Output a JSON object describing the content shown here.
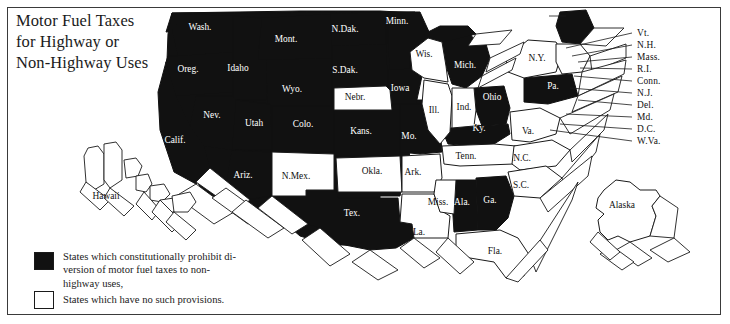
{
  "title": {
    "line1": "Motor Fuel Taxes",
    "line2": "for Highway or",
    "line3": "Non-Highway Uses"
  },
  "legend": {
    "items": [
      {
        "swatch": "black",
        "line1": "States which constitutionally prohibit di-",
        "line2": "version of motor fuel taxes to non-",
        "line3": "highway uses,"
      },
      {
        "swatch": "white",
        "line1": "States which have no such provisions."
      }
    ]
  },
  "colors": {
    "prohibit_fill": "#111111",
    "no_provision_fill": "#ffffff",
    "stroke": "#1a1a1a",
    "label_on_black": "#ffffff",
    "label_on_white": "#111111",
    "frame": "#3a3a3a",
    "page_background": "#ffffff"
  },
  "map": {
    "title": "Motor Fuel Taxes for Highway or Non-Highway Uses",
    "projection_note": "stylized 3D extruded block map of the United States",
    "states": [
      {
        "abbr": "Wash.",
        "name": "Washington",
        "status": "prohibit",
        "label_x": 200,
        "label_y": 30
      },
      {
        "abbr": "Oreg.",
        "name": "Oregon",
        "status": "prohibit",
        "label_x": 188,
        "label_y": 72
      },
      {
        "abbr": "Idaho",
        "name": "Idaho",
        "status": "prohibit",
        "label_x": 238,
        "label_y": 71
      },
      {
        "abbr": "Mont.",
        "name": "Montana",
        "status": "prohibit",
        "label_x": 286,
        "label_y": 42
      },
      {
        "abbr": "N.Dak.",
        "name": "North Dakota",
        "status": "prohibit",
        "label_x": 345,
        "label_y": 32
      },
      {
        "abbr": "S.Dak.",
        "name": "South Dakota",
        "status": "prohibit",
        "label_x": 345,
        "label_y": 73
      },
      {
        "abbr": "Wyo.",
        "name": "Wyoming",
        "status": "prohibit",
        "label_x": 292,
        "label_y": 92
      },
      {
        "abbr": "Nev.",
        "name": "Nevada",
        "status": "prohibit",
        "label_x": 212,
        "label_y": 118
      },
      {
        "abbr": "Utah",
        "name": "Utah",
        "status": "prohibit",
        "label_x": 254,
        "label_y": 126
      },
      {
        "abbr": "Colo.",
        "name": "Colorado",
        "status": "prohibit",
        "label_x": 303,
        "label_y": 127
      },
      {
        "abbr": "Calif.",
        "name": "California",
        "status": "prohibit",
        "label_x": 175,
        "label_y": 143
      },
      {
        "abbr": "Ariz.",
        "name": "Arizona",
        "status": "prohibit",
        "label_x": 243,
        "label_y": 178
      },
      {
        "abbr": "N.Mex.",
        "name": "New Mexico",
        "status": "no-provision",
        "label_x": 296,
        "label_y": 179
      },
      {
        "abbr": "Nebr.",
        "name": "Nebraska",
        "status": "no-provision",
        "label_x": 355,
        "label_y": 100
      },
      {
        "abbr": "Kans.",
        "name": "Kansas",
        "status": "prohibit",
        "label_x": 361,
        "label_y": 134
      },
      {
        "abbr": "Okla.",
        "name": "Oklahoma",
        "status": "no-provision",
        "label_x": 372,
        "label_y": 174
      },
      {
        "abbr": "Tex.",
        "name": "Texas",
        "status": "prohibit",
        "label_x": 352,
        "label_y": 216
      },
      {
        "abbr": "Minn.",
        "name": "Minnesota",
        "status": "prohibit",
        "label_x": 397,
        "label_y": 24
      },
      {
        "abbr": "Iowa",
        "name": "Iowa",
        "status": "prohibit",
        "label_x": 400,
        "label_y": 91
      },
      {
        "abbr": "Mo.",
        "name": "Missouri",
        "status": "prohibit",
        "label_x": 409,
        "label_y": 139
      },
      {
        "abbr": "Ark.",
        "name": "Arkansas",
        "status": "no-provision",
        "label_x": 413,
        "label_y": 175
      },
      {
        "abbr": "La.",
        "name": "Louisiana",
        "status": "no-provision",
        "label_x": 419,
        "label_y": 235
      },
      {
        "abbr": "Wis.",
        "name": "Wisconsin",
        "status": "no-provision",
        "label_x": 424,
        "label_y": 57
      },
      {
        "abbr": "Ill.",
        "name": "Illinois",
        "status": "no-provision",
        "label_x": 434,
        "label_y": 113
      },
      {
        "abbr": "Mich.",
        "name": "Michigan",
        "status": "prohibit",
        "label_x": 465,
        "label_y": 68
      },
      {
        "abbr": "Ind.",
        "name": "Indiana",
        "status": "no-provision",
        "label_x": 464,
        "label_y": 110
      },
      {
        "abbr": "Ohio",
        "name": "Ohio",
        "status": "prohibit",
        "label_x": 492,
        "label_y": 100
      },
      {
        "abbr": "Ky.",
        "name": "Kentucky",
        "status": "prohibit",
        "label_x": 479,
        "label_y": 131
      },
      {
        "abbr": "Tenn.",
        "name": "Tennessee",
        "status": "no-provision",
        "label_x": 466,
        "label_y": 159
      },
      {
        "abbr": "Miss.",
        "name": "Mississippi",
        "status": "no-provision",
        "label_x": 438,
        "label_y": 205
      },
      {
        "abbr": "Ala.",
        "name": "Alabama",
        "status": "prohibit",
        "label_x": 462,
        "label_y": 205
      },
      {
        "abbr": "Ga.",
        "name": "Georgia",
        "status": "prohibit",
        "label_x": 490,
        "label_y": 203
      },
      {
        "abbr": "Fla.",
        "name": "Florida",
        "status": "no-provision",
        "label_x": 495,
        "label_y": 254
      },
      {
        "abbr": "S.C.",
        "name": "South Carolina",
        "status": "no-provision",
        "label_x": 521,
        "label_y": 188
      },
      {
        "abbr": "N.C.",
        "name": "North Carolina",
        "status": "no-provision",
        "label_x": 522,
        "label_y": 161
      },
      {
        "abbr": "Va.",
        "name": "Virginia",
        "status": "no-provision",
        "label_x": 528,
        "label_y": 134
      },
      {
        "abbr": "Pa.",
        "name": "Pennsylvania",
        "status": "prohibit",
        "label_x": 553,
        "label_y": 89
      },
      {
        "abbr": "N.Y.",
        "name": "New York",
        "status": "no-provision",
        "label_x": 537,
        "label_y": 61
      },
      {
        "abbr": "Maine",
        "name": "Maine",
        "status": "prohibit",
        "label_x": 527,
        "label_y": 16
      },
      {
        "abbr": "Hawaii",
        "name": "Hawaii",
        "status": "no-provision",
        "label_x": 106,
        "label_y": 199
      },
      {
        "abbr": "Alaska",
        "name": "Alaska",
        "status": "no-provision",
        "label_x": 622,
        "label_y": 208
      }
    ],
    "leader_labels": [
      {
        "abbr": "Vt.",
        "name": "Vermont",
        "status": "no-provision",
        "y": 34
      },
      {
        "abbr": "N.H.",
        "name": "New Hampshire",
        "status": "no-provision",
        "y": 46
      },
      {
        "abbr": "Mass.",
        "name": "Massachusetts",
        "status": "no-provision",
        "y": 58
      },
      {
        "abbr": "R.I.",
        "name": "Rhode Island",
        "status": "no-provision",
        "y": 70
      },
      {
        "abbr": "Conn.",
        "name": "Connecticut",
        "status": "no-provision",
        "y": 82
      },
      {
        "abbr": "N.J.",
        "name": "New Jersey",
        "status": "no-provision",
        "y": 94
      },
      {
        "abbr": "Del.",
        "name": "Delaware",
        "status": "no-provision",
        "y": 106
      },
      {
        "abbr": "Md.",
        "name": "Maryland",
        "status": "no-provision",
        "y": 118
      },
      {
        "abbr": "D.C.",
        "name": "District of Columbia",
        "status": "no-provision",
        "y": 130
      },
      {
        "abbr": "W.Va.",
        "name": "West Virginia",
        "status": "no-provision",
        "y": 142
      }
    ]
  }
}
